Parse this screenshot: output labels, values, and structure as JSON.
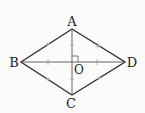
{
  "diagram": {
    "type": "rhombus-with-diagonals",
    "points": {
      "A": {
        "label": "A",
        "x": 72,
        "y": 29
      },
      "B": {
        "label": "B",
        "x": 21,
        "y": 62
      },
      "C": {
        "label": "C",
        "x": 72,
        "y": 95
      },
      "D": {
        "label": "D",
        "x": 125,
        "y": 62
      },
      "O": {
        "label": "O",
        "x": 72,
        "y": 62
      }
    },
    "labels": {
      "A": "A",
      "B": "B",
      "C": "C",
      "D": "D",
      "O": "O"
    },
    "marks": {
      "sides_equal": "circle tick on AB, AD, BC, CD",
      "diagonal_halves": "circle marks on AO, OC; tick marks on BO, OD",
      "right_angle": "at O"
    },
    "colors": {
      "line": "#333333",
      "thin_line": "#555555",
      "mark": "#999999"
    }
  }
}
